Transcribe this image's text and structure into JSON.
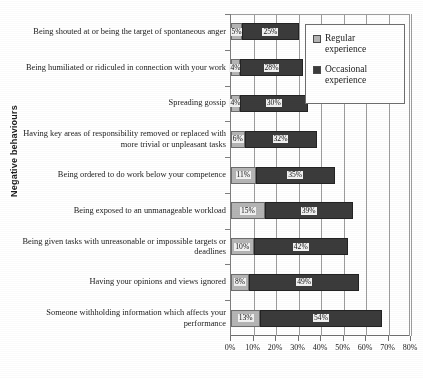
{
  "chart_data": {
    "type": "bar",
    "orientation": "horizontal",
    "stacked": true,
    "title": "",
    "xlabel": "",
    "ylabel": "Negative behaviours",
    "xlim": [
      0,
      80
    ],
    "xtick_labels": [
      "0%",
      "10%",
      "20%",
      "30%",
      "40%",
      "50%",
      "60%",
      "70%",
      "80%"
    ],
    "xticks": [
      0,
      10,
      20,
      30,
      40,
      50,
      60,
      70,
      80
    ],
    "grid": true,
    "legend_position": "upper-right-inside",
    "categories": [
      "Being shouted at or being the target of spontaneous anger",
      "Being humiliated or ridiculed in connection with your work",
      "Spreading gossip",
      "Having key areas of responsibility removed or replaced with more trivial or unpleasant tasks",
      "Being ordered to do work below your competence",
      "Being exposed to an unmanageable workload",
      "Being given tasks with unreasonable or impossible targets or deadlines",
      "Having your opinions and views ignored",
      "Someone withholding information which affects your performance"
    ],
    "series": [
      {
        "name": "Regular experience",
        "color": "#b5b5b5",
        "values": [
          5,
          4,
          4,
          6,
          11,
          15,
          10,
          8,
          13
        ],
        "labels": [
          "5%",
          "4%",
          "4%",
          "6%",
          "11%",
          "15%",
          "10%",
          "8%",
          "13%"
        ]
      },
      {
        "name": "Occasional experience",
        "color": "#3b3b3b",
        "values": [
          25,
          28,
          30,
          32,
          35,
          39,
          42,
          49,
          54
        ],
        "labels": [
          "25%",
          "28%",
          "30%",
          "32%",
          "35%",
          "39%",
          "42%",
          "49%",
          "54%"
        ]
      }
    ]
  },
  "legend": {
    "items": [
      {
        "label": "Regular experience",
        "swatch": "regular"
      },
      {
        "label": "Occasional experience",
        "swatch": "occasional"
      }
    ]
  }
}
